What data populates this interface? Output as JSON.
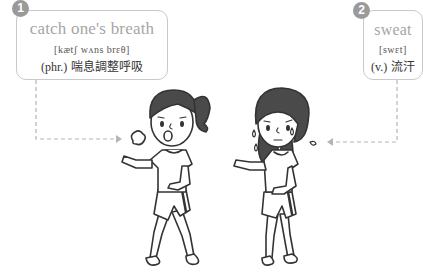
{
  "vocab": [
    {
      "number": "1",
      "term": "catch one's breath",
      "phonetic": "[kætʃ wʌns brɛθ]",
      "part_of_speech": "(phr.)",
      "definition": "喘息調整呼吸"
    },
    {
      "number": "2",
      "term": "sweat",
      "phonetic": "[swɛt]",
      "part_of_speech": "(v.)",
      "definition": "流汗"
    }
  ],
  "colors": {
    "badge": "#9a9a9a",
    "term_text": "#a6a6a6",
    "card_border": "#c9c9c9",
    "connector": "#b5b5b5",
    "hair": "#4a4a4a",
    "outline": "#333333"
  },
  "illustrations": [
    {
      "name": "girl-catching-breath",
      "description": "ponytail girl panting with breath puff"
    },
    {
      "name": "girl-sweating",
      "description": "long-haired girl with sweat drops"
    }
  ]
}
